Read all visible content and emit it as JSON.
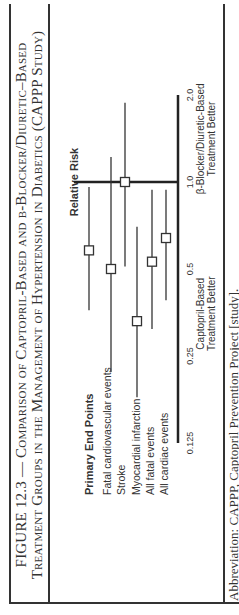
{
  "figure": {
    "title_line1": "FIGURE 12.3 — Comparison of Captopril-Based and β-Blocker/Diuretic–Based",
    "title_line2": "Treatment Groups in the Management of Hypertension in Diabetics (CAPPP Study)",
    "caption": "Abbreviation: CAPPP, Captopril Prevention Project [study]."
  },
  "chart_data": {
    "type": "forest",
    "title": "Comparison of Captopril-Based and β-Blocker/Diuretic–Based Treatment Groups in the Management of Hypertension in Diabetics (CAPPP Study)",
    "axis_title": "Relative Risk",
    "scale": "log2",
    "ticks": [
      0.125,
      0.25,
      0.5,
      1.0,
      2.0
    ],
    "tick_labels": [
      "0.125",
      "0.25",
      "0.5",
      "1.0",
      "2.0"
    ],
    "xlim": [
      0.125,
      2.0
    ],
    "reference_line": 1.0,
    "left_annotation": [
      "Captopril-Based",
      "Treatment Better"
    ],
    "right_annotation": [
      "β-Blocker/Diuretic-Based",
      "Treatment Better"
    ],
    "group_header": "Primary End Points",
    "rows": [
      {
        "label": "Primary End Points",
        "rr": 0.58,
        "ci_low": 0.36,
        "ci_high": 0.96
      },
      {
        "label": "Fatal cardiovascular events",
        "rr": 0.5,
        "ci_low": 0.22,
        "ci_high": 1.22
      },
      {
        "label": "Stroke",
        "rr": 1.0,
        "ci_low": 0.51,
        "ci_high": 1.88
      },
      {
        "label": "Myocardial infarction",
        "rr": 0.33,
        "ci_low": 0.18,
        "ci_high": 0.7
      },
      {
        "label": "All fatal events",
        "rr": 0.53,
        "ci_low": 0.31,
        "ci_high": 0.94
      },
      {
        "label": "All cardiac events",
        "rr": 0.64,
        "ci_low": 0.39,
        "ci_high": 0.94
      }
    ],
    "labels": [
      "Fatal cardiovascular events",
      "Stroke",
      "Myocardial infarction",
      "All fatal events",
      "All cardiac events"
    ]
  }
}
